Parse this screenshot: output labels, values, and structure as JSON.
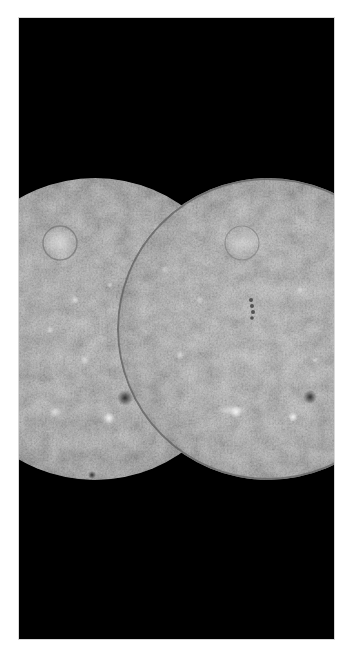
{
  "image": {
    "subject": "Mercury",
    "description": "Two adjacent hemispheric views of a cratered gray planet on a black background",
    "background_color": "#000000",
    "page_color": "#ffffff",
    "frame": {
      "x": 19,
      "y": 18,
      "width": 315,
      "height": 621
    },
    "spheres": [
      {
        "name": "left-hemisphere",
        "cx": 95,
        "cy": 329,
        "r": 151,
        "tone": "#8a8a8a"
      },
      {
        "name": "right-hemisphere",
        "cx": 268,
        "cy": 329,
        "r": 151,
        "tone": "#9a9a9a"
      }
    ],
    "features": [
      {
        "name": "left-basin",
        "x": 60,
        "y": 243,
        "r": 17,
        "kind": "bright-basin"
      },
      {
        "name": "right-basin",
        "x": 242,
        "y": 243,
        "r": 17,
        "kind": "bright-basin"
      },
      {
        "name": "left-dark-crater",
        "x": 125,
        "y": 398,
        "r": 8,
        "kind": "dark-crater"
      },
      {
        "name": "left-bright-spot",
        "x": 109,
        "y": 418,
        "r": 6,
        "kind": "bright-spot"
      },
      {
        "name": "right-dark-crater",
        "x": 310,
        "y": 397,
        "r": 7,
        "kind": "dark-crater"
      },
      {
        "name": "right-bright-spot-1",
        "x": 293,
        "y": 417,
        "r": 5,
        "kind": "bright-spot"
      },
      {
        "name": "right-bright-spot-2",
        "x": 236,
        "y": 412,
        "r": 6,
        "kind": "bright-spot"
      },
      {
        "name": "right-crater-chain",
        "x": 252,
        "y": 309,
        "r": 4,
        "kind": "crater-chain"
      },
      {
        "name": "left-bottom-dark-crater",
        "x": 92,
        "y": 475,
        "r": 4,
        "kind": "dark-crater"
      }
    ]
  }
}
